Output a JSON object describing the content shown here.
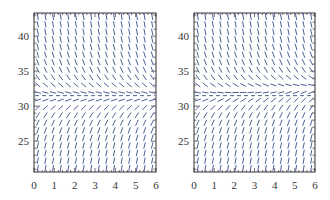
{
  "chart_data": [
    {
      "type": "slope-field",
      "title": "",
      "xlabel": "",
      "ylabel": "",
      "xlim": [
        0,
        6
      ],
      "ylim": [
        20.6,
        43.3
      ],
      "x_ticks": [
        0,
        1,
        2,
        3,
        4,
        5,
        6
      ],
      "y_ticks": [
        25,
        30,
        35,
        40
      ],
      "grid_cols": 16,
      "grid_rows": 21,
      "equilibrium": {
        "y": 31.5,
        "style": "dashed"
      },
      "slope_model": "autonomous",
      "description": "Segments steep negative above y≈31.5, steep positive below, flattening near the dashed equilibrium line"
    },
    {
      "type": "slope-field",
      "title": "",
      "xlabel": "",
      "ylabel": "",
      "xlim": [
        0,
        6
      ],
      "ylim": [
        20.6,
        43.3
      ],
      "x_ticks": [
        0,
        1,
        2,
        3,
        4,
        5,
        6
      ],
      "y_ticks": [
        25,
        30,
        35,
        40
      ],
      "grid_cols": 16,
      "grid_rows": 21,
      "equilibrium": {
        "y": 31.5,
        "style": "dashed"
      },
      "slope_model": "time-varying",
      "description": "Similar to left, but slopes near y≈31.5 tilt increasingly positive as x increases"
    }
  ],
  "colors": {
    "segment": "#3a4f8a",
    "frame": "#333333",
    "equilibrium": "#3a4f8a"
  },
  "panels": [
    {
      "x0": 34,
      "x1": 156,
      "y0": 13,
      "y1": 172
    },
    {
      "x0": 194,
      "x1": 315,
      "y0": 13,
      "y1": 172
    }
  ]
}
